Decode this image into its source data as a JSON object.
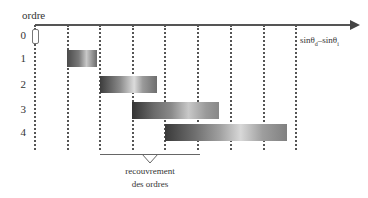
{
  "diagram": {
    "y_axis_title": "ordre",
    "x_axis_label": "sinθd–sinθi",
    "x_axis_label_parts": {
      "a": "sinθ",
      "a_sub": "d",
      "sep": "–",
      "b": "sinθ",
      "b_sub": "i"
    },
    "orders": [
      {
        "label": "0"
      },
      {
        "label": "1"
      },
      {
        "label": "2"
      },
      {
        "label": "3"
      },
      {
        "label": "4"
      }
    ],
    "overlap_annotation": {
      "line1": "recouvrement",
      "line2": "des ordres"
    },
    "colors": {
      "axis": "#555555",
      "bar_dark": "#3a3a3a",
      "bar_light": "#d8d8d8",
      "background": "#ffffff"
    }
  }
}
